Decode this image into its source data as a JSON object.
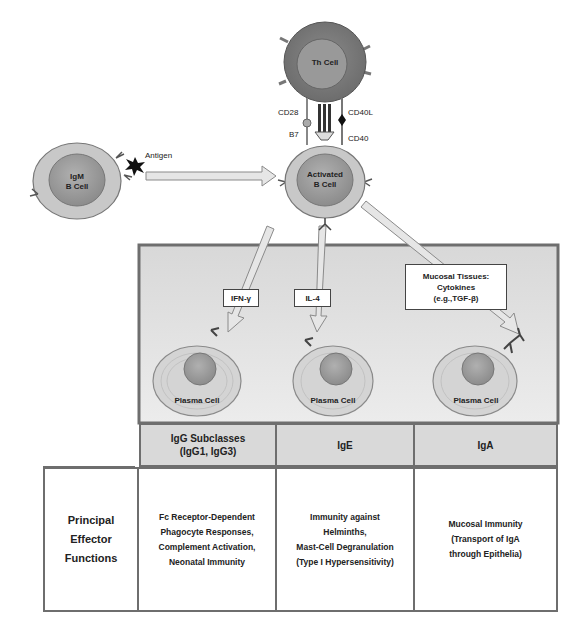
{
  "cells": {
    "th_cell": "Th Cell",
    "igm_b_cell": "IgM\nB Cell",
    "activated_b_cell": "Activated\nB Cell",
    "plasma_cells": [
      "Plasma Cell",
      "Plasma Cell",
      "Plasma Cell"
    ]
  },
  "molecules": {
    "antigen": "Antigen",
    "cd28": "CD28",
    "b7": "B7",
    "cd40l": "CD40L",
    "cd40": "CD40"
  },
  "cytokines": [
    {
      "label": "IFN-γ"
    },
    {
      "label": "IL-4"
    },
    {
      "label": "Mucosal Tissues:\nCytokines\n(e.g.,TGF-β)"
    }
  ],
  "table": {
    "headers": [
      "IgG Subclasses\n(IgG1, IgG3)",
      "IgE",
      "IgA"
    ],
    "row_title": "Principal\nEffector\nFunctions",
    "functions": [
      "Fc Receptor-Dependent\nPhagocyte Responses,\nComplement Activation,\nNeonatal Immunity",
      "Immunity against\nHelminths,\nMast-Cell Degranulation\n(Type I Hypersensitivity)",
      "Mucosal Immunity\n(Transport of IgA\nthrough Epithelia)"
    ]
  },
  "colors": {
    "panel_bg": "#e4e4e4",
    "header_bg": "#d9d9d9",
    "border": "#6e6e6e",
    "cell_outer": "#c8c8c8",
    "nucleus": "#9a9a9a",
    "th_cell": "#7a7a7a"
  }
}
